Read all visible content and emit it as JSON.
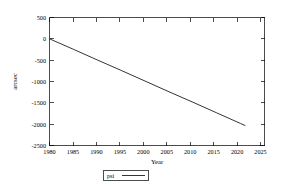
{
  "chart_data": {
    "type": "line",
    "title": "",
    "xlabel": "Year",
    "ylabel": "arcsec",
    "xlim": [
      1980,
      2025
    ],
    "ylim": [
      -2500,
      500
    ],
    "grid": false,
    "legend_position": "bottom-center",
    "xticks": [
      1980,
      1985,
      1990,
      1995,
      2000,
      2005,
      2010,
      2015,
      2020,
      2025
    ],
    "xtick_labels": [
      "1980",
      "1985",
      "1990",
      "1995",
      "2000",
      "2005",
      "2010",
      "2015",
      "2020",
      "2025"
    ],
    "yticks": [
      500,
      0,
      -500,
      -1000,
      -1500,
      -2000,
      -2500
    ],
    "ytick_labels": [
      "500",
      "0",
      "-500",
      "-1000",
      "-1500",
      "-2000",
      "-2500"
    ],
    "series": [
      {
        "name": "psi",
        "color": "#000000",
        "x": [
          1980,
          1985,
          1990,
          1995,
          2000,
          2005,
          2010,
          2015,
          2020,
          2021
        ],
        "values": [
          0,
          -245,
          -495,
          -740,
          -990,
          -1240,
          -1485,
          -1735,
          -1985,
          -2035
        ]
      }
    ]
  },
  "legend": {
    "entries": [
      {
        "label": "psi"
      }
    ]
  },
  "axes": {
    "x_title": "Year",
    "y_title": "arcsec"
  }
}
